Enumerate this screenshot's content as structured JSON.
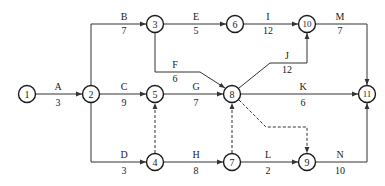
{
  "diagram": {
    "type": "activity-on-arrow network",
    "nodes": [
      {
        "id": "1",
        "x": 27,
        "y": 94
      },
      {
        "id": "2",
        "x": 91,
        "y": 94
      },
      {
        "id": "3",
        "x": 155,
        "y": 24
      },
      {
        "id": "4",
        "x": 155,
        "y": 162
      },
      {
        "id": "5",
        "x": 155,
        "y": 94
      },
      {
        "id": "6",
        "x": 235,
        "y": 24
      },
      {
        "id": "7",
        "x": 232,
        "y": 162
      },
      {
        "id": "8",
        "x": 232,
        "y": 94
      },
      {
        "id": "9",
        "x": 307,
        "y": 162
      },
      {
        "id": "10",
        "x": 307,
        "y": 24
      },
      {
        "id": "11",
        "x": 367,
        "y": 94
      }
    ],
    "activities": [
      {
        "name": "A",
        "duration": "3",
        "from": "1",
        "to": "2"
      },
      {
        "name": "B",
        "duration": "7",
        "from": "2",
        "to": "3"
      },
      {
        "name": "C",
        "duration": "9",
        "from": "2",
        "to": "5"
      },
      {
        "name": "D",
        "duration": "3",
        "from": "2",
        "to": "4"
      },
      {
        "name": "E",
        "duration": "5",
        "from": "3",
        "to": "6"
      },
      {
        "name": "F",
        "duration": "6",
        "from": "3",
        "to": "8"
      },
      {
        "name": "G",
        "duration": "7",
        "from": "5",
        "to": "8"
      },
      {
        "name": "H",
        "duration": "8",
        "from": "4",
        "to": "7"
      },
      {
        "name": "I",
        "duration": "12",
        "from": "6",
        "to": "10"
      },
      {
        "name": "J",
        "duration": "12",
        "from": "8",
        "to": "10"
      },
      {
        "name": "K",
        "duration": "6",
        "from": "8",
        "to": "11"
      },
      {
        "name": "L",
        "duration": "2",
        "from": "7",
        "to": "9"
      },
      {
        "name": "M",
        "duration": "7",
        "from": "10",
        "to": "11"
      },
      {
        "name": "N",
        "duration": "10",
        "from": "9",
        "to": "11"
      }
    ],
    "dummies": [
      {
        "from": "4",
        "to": "5"
      },
      {
        "from": "7",
        "to": "8"
      },
      {
        "from": "8",
        "to": "9"
      }
    ]
  }
}
